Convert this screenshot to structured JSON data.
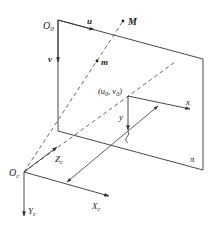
{
  "diagram": {
    "colors": {
      "line": "#333333",
      "background": "#ffffff"
    },
    "image_plane": {
      "label": "π",
      "corners": {
        "top_left": [
          58,
          20
        ],
        "top_right": [
          203,
          59
        ],
        "bottom_right": [
          203,
          170
        ],
        "bottom_left": [
          58,
          131
        ]
      }
    },
    "pixel_coords": {
      "origin_label": "O",
      "origin_sub": "0",
      "u_label": "u",
      "v_label": "v"
    },
    "image_coords": {
      "principal_point_label": "(u₀, v₀)",
      "principal_point_text": "(u",
      "pp_sub0": "0",
      "pp_mid": ", v",
      "pp_sub1": "0",
      "pp_end": ")",
      "x_label": "x",
      "y_label": "y"
    },
    "points": {
      "world_point_label": "M",
      "image_point_label": "m"
    },
    "camera_coords": {
      "origin_label": "O",
      "origin_sub": "c",
      "xc_label": "X",
      "xc_sub": "c",
      "yc_label": "Y",
      "yc_sub": "c",
      "zc_label": "Z",
      "zc_sub": "c"
    },
    "focal_length_marker": "f"
  }
}
